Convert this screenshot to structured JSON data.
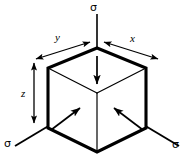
{
  "figure": {
    "type": "isometric-cube-stress-diagram",
    "background_color": "#ffffff",
    "line_color": "#000000",
    "labels": {
      "sigma_top": "σ",
      "sigma_bottom_left": "σ",
      "sigma_bottom_right": "σ",
      "axis_x": "x",
      "axis_y": "y",
      "axis_z": "z"
    },
    "geometry": {
      "vertices": {
        "top": [
          97,
          48
        ],
        "upper_left": [
          48,
          68
        ],
        "upper_right": [
          146,
          68
        ],
        "center": [
          97,
          93
        ],
        "lower_left": [
          48,
          128
        ],
        "lower_right": [
          146,
          128
        ],
        "bottom": [
          97,
          152
        ]
      },
      "outer_edge_width": 3,
      "inner_edge_width": 1.2
    },
    "stress_arrows": [
      {
        "name": "top-face-stress-arrow",
        "from": [
          97,
          55
        ],
        "to": [
          97,
          86
        ],
        "direction": "down"
      },
      {
        "name": "left-face-stress-arrow",
        "from": [
          48,
          128
        ],
        "to": [
          82,
          104
        ],
        "direction": "up-right"
      },
      {
        "name": "right-face-stress-arrow",
        "from": [
          146,
          128
        ],
        "to": [
          112,
          104
        ],
        "direction": "up-left"
      }
    ],
    "load_lines": [
      {
        "name": "top-load-line",
        "from": [
          97,
          14
        ],
        "to": [
          97,
          90
        ]
      },
      {
        "name": "left-load-line",
        "from": [
          14,
          146
        ],
        "to": [
          97,
          97
        ]
      },
      {
        "name": "right-load-line",
        "from": [
          180,
          146
        ],
        "to": [
          97,
          97
        ]
      }
    ],
    "dimension_arrows": [
      {
        "name": "y-dimension-arrow",
        "from": [
          34,
          59
        ],
        "to": [
          92,
          42
        ],
        "double_headed": true
      },
      {
        "name": "x-dimension-arrow",
        "from": [
          102,
          42
        ],
        "to": [
          160,
          59
        ],
        "double_headed": true
      },
      {
        "name": "z-dimension-arrow",
        "from": [
          34,
          62
        ],
        "to": [
          34,
          124
        ],
        "double_headed": true
      }
    ]
  }
}
